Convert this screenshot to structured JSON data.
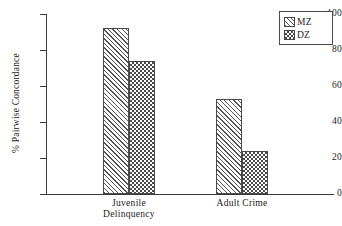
{
  "chart_data": {
    "type": "bar",
    "title": "",
    "subtitle": "",
    "xlabel": "",
    "ylabel": "% Pairwise Concordance",
    "categories": [
      "Juvenile Delinquency",
      "Adult Crime"
    ],
    "category_lines": [
      [
        "Juvenile",
        "Delinquency"
      ],
      [
        "Adult Crime"
      ]
    ],
    "series": [
      {
        "name": "MZ",
        "pattern": "diagonal-hatch",
        "values": [
          92,
          53
        ]
      },
      {
        "name": "DZ",
        "pattern": "checkerboard",
        "values": [
          74,
          24
        ]
      }
    ],
    "ylim": [
      0,
      100
    ],
    "yticks": [
      0,
      20,
      40,
      60,
      80,
      100
    ],
    "ytick_labels": [
      "0",
      "20",
      "40",
      "60",
      "80",
      "100"
    ],
    "grid": false,
    "legend_position": "top-right",
    "legend_entries": [
      {
        "label": "MZ",
        "swatch": "diagonal-hatch-swatch"
      },
      {
        "label": "DZ",
        "swatch": "checkerboard-swatch"
      }
    ],
    "colors": {
      "axis": "#3a3a3a",
      "bar_outline": "#4a4a4a",
      "pattern_ink": "#4a4a4a",
      "background": "#ffffff",
      "text": "#1a1a1a"
    }
  }
}
